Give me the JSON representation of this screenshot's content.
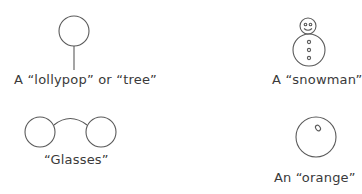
{
  "figures": [
    {
      "id": "lollypop",
      "label": "A “lollypop” or “tree”"
    },
    {
      "id": "snowman",
      "label": "A “snowman”"
    },
    {
      "id": "glasses",
      "label": "“Glasses”"
    },
    {
      "id": "orange",
      "label": "An “orange”"
    }
  ],
  "colors": {
    "stroke": "#555555",
    "text": "#3a3a3a",
    "background": "#ffffff"
  }
}
